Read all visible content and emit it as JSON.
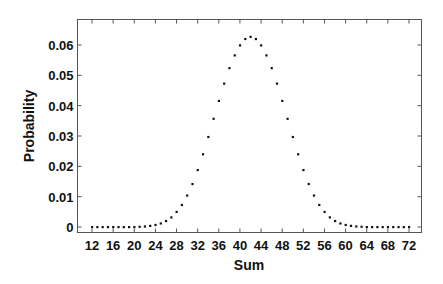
{
  "chart_data": {
    "type": "scatter",
    "title": "",
    "xlabel": "Sum",
    "ylabel": "Probability",
    "xlim": [
      9,
      74
    ],
    "ylim": [
      -0.0017,
      0.0685
    ],
    "x_ticks": [
      12,
      16,
      20,
      24,
      28,
      32,
      36,
      40,
      44,
      48,
      52,
      56,
      60,
      64,
      68,
      72
    ],
    "x_tick_labels": [
      "12",
      "16",
      "20",
      "24",
      "28",
      "32",
      "36",
      "40",
      "44",
      "48",
      "52",
      "56",
      "60",
      "64",
      "68",
      "72"
    ],
    "y_ticks": [
      0,
      0.01,
      0.02,
      0.03,
      0.04,
      0.05,
      0.06
    ],
    "y_tick_labels": [
      "0",
      "0.01",
      "0.02",
      "0.03",
      "0.04",
      "0.05",
      "0.06"
    ],
    "grid": false,
    "legend": null,
    "marker": "dot",
    "marker_color": "#111111",
    "x": [
      12,
      13,
      14,
      15,
      16,
      17,
      18,
      19,
      20,
      21,
      22,
      23,
      24,
      25,
      26,
      27,
      28,
      29,
      30,
      31,
      32,
      33,
      34,
      35,
      36,
      37,
      38,
      39,
      40,
      41,
      42,
      43,
      44,
      45,
      46,
      47,
      48,
      49,
      50,
      51,
      52,
      53,
      54,
      55,
      56,
      57,
      58,
      59,
      60,
      61,
      62,
      63,
      64,
      65,
      66,
      67,
      68,
      69,
      70,
      71,
      72
    ],
    "values": [
      0.0,
      0.0,
      0.0,
      0.0,
      0.0,
      0.0,
      0.0,
      0.0,
      0.0,
      0.0001,
      0.0002,
      0.0004,
      0.0007,
      0.0012,
      0.002,
      0.0032,
      0.005,
      0.0073,
      0.0104,
      0.0142,
      0.0188,
      0.024,
      0.0297,
      0.0357,
      0.0416,
      0.0473,
      0.0524,
      0.0566,
      0.0599,
      0.062,
      0.0627,
      0.062,
      0.0599,
      0.0566,
      0.0524,
      0.0473,
      0.0416,
      0.0357,
      0.0297,
      0.024,
      0.0188,
      0.0142,
      0.0104,
      0.0073,
      0.005,
      0.0032,
      0.002,
      0.0012,
      0.0007,
      0.0004,
      0.0002,
      0.0001,
      0.0,
      0.0,
      0.0,
      0.0,
      0.0,
      0.0,
      0.0,
      0.0,
      0.0
    ]
  },
  "colors": {
    "axis": "#444444",
    "text": "#111111",
    "background": "#ffffff"
  }
}
